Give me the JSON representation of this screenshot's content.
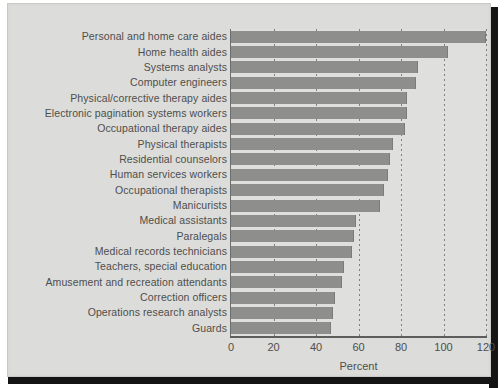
{
  "chart_data": {
    "type": "bar",
    "orientation": "horizontal",
    "title": "",
    "xlabel": "Percent",
    "ylabel": "",
    "xlim": [
      0,
      120
    ],
    "xticks": [
      0,
      20,
      40,
      60,
      80,
      100,
      120
    ],
    "grid": "vertical-dotted",
    "legend": "none",
    "bar_color": "#8e8e8c",
    "background_color": "#dcdcda",
    "categories": [
      "Personal and home care aides",
      "Home health aides",
      "Systems analysts",
      "Computer engineers",
      "Physical/corrective therapy aides",
      "Electronic pagination systems workers",
      "Occupational therapy aides",
      "Physical therapists",
      "Residential counselors",
      "Human services workers",
      "Occupational therapists",
      "Manicurists",
      "Medical assistants",
      "Paralegals",
      "Medical records technicians",
      "Teachers, special education",
      "Amusement and recreation attendants",
      "Correction officers",
      "Operations research analysts",
      "Guards"
    ],
    "values": [
      120,
      102,
      88,
      87,
      83,
      83,
      82,
      76,
      75,
      74,
      72,
      70,
      59,
      58,
      57,
      53,
      52,
      49,
      48,
      47
    ]
  }
}
